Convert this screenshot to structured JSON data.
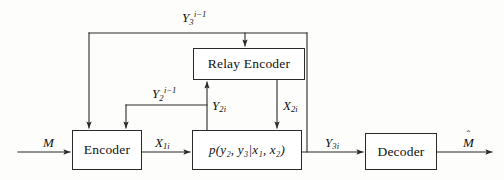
{
  "figure": {
    "type": "block-diagram",
    "domain": "information-theory",
    "width": 504,
    "height": 180,
    "background": "#fdfdfc",
    "line_color": "#2a2a2a",
    "text_color": "#111111"
  },
  "nodes": {
    "encoder": {
      "label": "Encoder",
      "x": 72,
      "y": 130,
      "w": 70,
      "h": 40
    },
    "relay_encoder": {
      "label": "Relay Encoder",
      "x": 193,
      "y": 48,
      "w": 112,
      "h": 32
    },
    "channel": {
      "label": "p(y₂, y₃|x₁, x₂)",
      "x": 192,
      "y": 130,
      "w": 110,
      "h": 40
    },
    "decoder": {
      "label": "Decoder",
      "x": 365,
      "y": 133,
      "w": 72,
      "h": 37
    }
  },
  "signals": {
    "message_in": {
      "base": "M",
      "sub": "",
      "sup": "",
      "x": 43,
      "y": 136
    },
    "message_out": {
      "base": "M",
      "sub": "",
      "sup": "",
      "hat": true,
      "x": 463,
      "y": 136
    },
    "x1i": {
      "base": "X",
      "sub": "1i",
      "sup": "",
      "x": 155,
      "y": 136
    },
    "x2i": {
      "base": "X",
      "sub": "2i",
      "sup": "",
      "x": 283,
      "y": 99
    },
    "y2i": {
      "base": "Y",
      "sub": "2i",
      "sup": "",
      "x": 212,
      "y": 99
    },
    "y3i": {
      "base": "Y",
      "sub": "3i",
      "sup": "",
      "x": 325,
      "y": 136
    },
    "y2_delay": {
      "base": "Y",
      "sub": "2",
      "sup": "i−1",
      "x": 152,
      "y": 84
    },
    "y3_delay": {
      "base": "Y",
      "sub": "3",
      "sup": "i−1",
      "x": 182,
      "y": 6
    }
  },
  "wires": [
    {
      "name": "m-to-encoder",
      "from": "message-source",
      "to": "encoder"
    },
    {
      "name": "encoder-to-channel",
      "from": "encoder",
      "to": "channel",
      "signal": "X1i"
    },
    {
      "name": "channel-to-decoder",
      "from": "channel",
      "to": "decoder",
      "signal": "Y3i"
    },
    {
      "name": "decoder-to-output",
      "from": "decoder",
      "to": "message-estimate"
    },
    {
      "name": "channel-to-relay",
      "from": "channel",
      "to": "relay-encoder",
      "signal": "Y2i"
    },
    {
      "name": "relay-to-channel",
      "from": "relay-encoder",
      "to": "channel",
      "signal": "X2i"
    },
    {
      "name": "y3-feedback-to-encoder",
      "from": "channel-output-y3",
      "to": "encoder",
      "signal": "Y3 i-1"
    },
    {
      "name": "y3-feedback-to-relay",
      "from": "channel-output-y3",
      "to": "relay-encoder",
      "signal": "Y3 i-1"
    },
    {
      "name": "y2-feedback-to-encoder",
      "from": "relay-input-y2",
      "to": "encoder",
      "signal": "Y2 i-1"
    }
  ]
}
